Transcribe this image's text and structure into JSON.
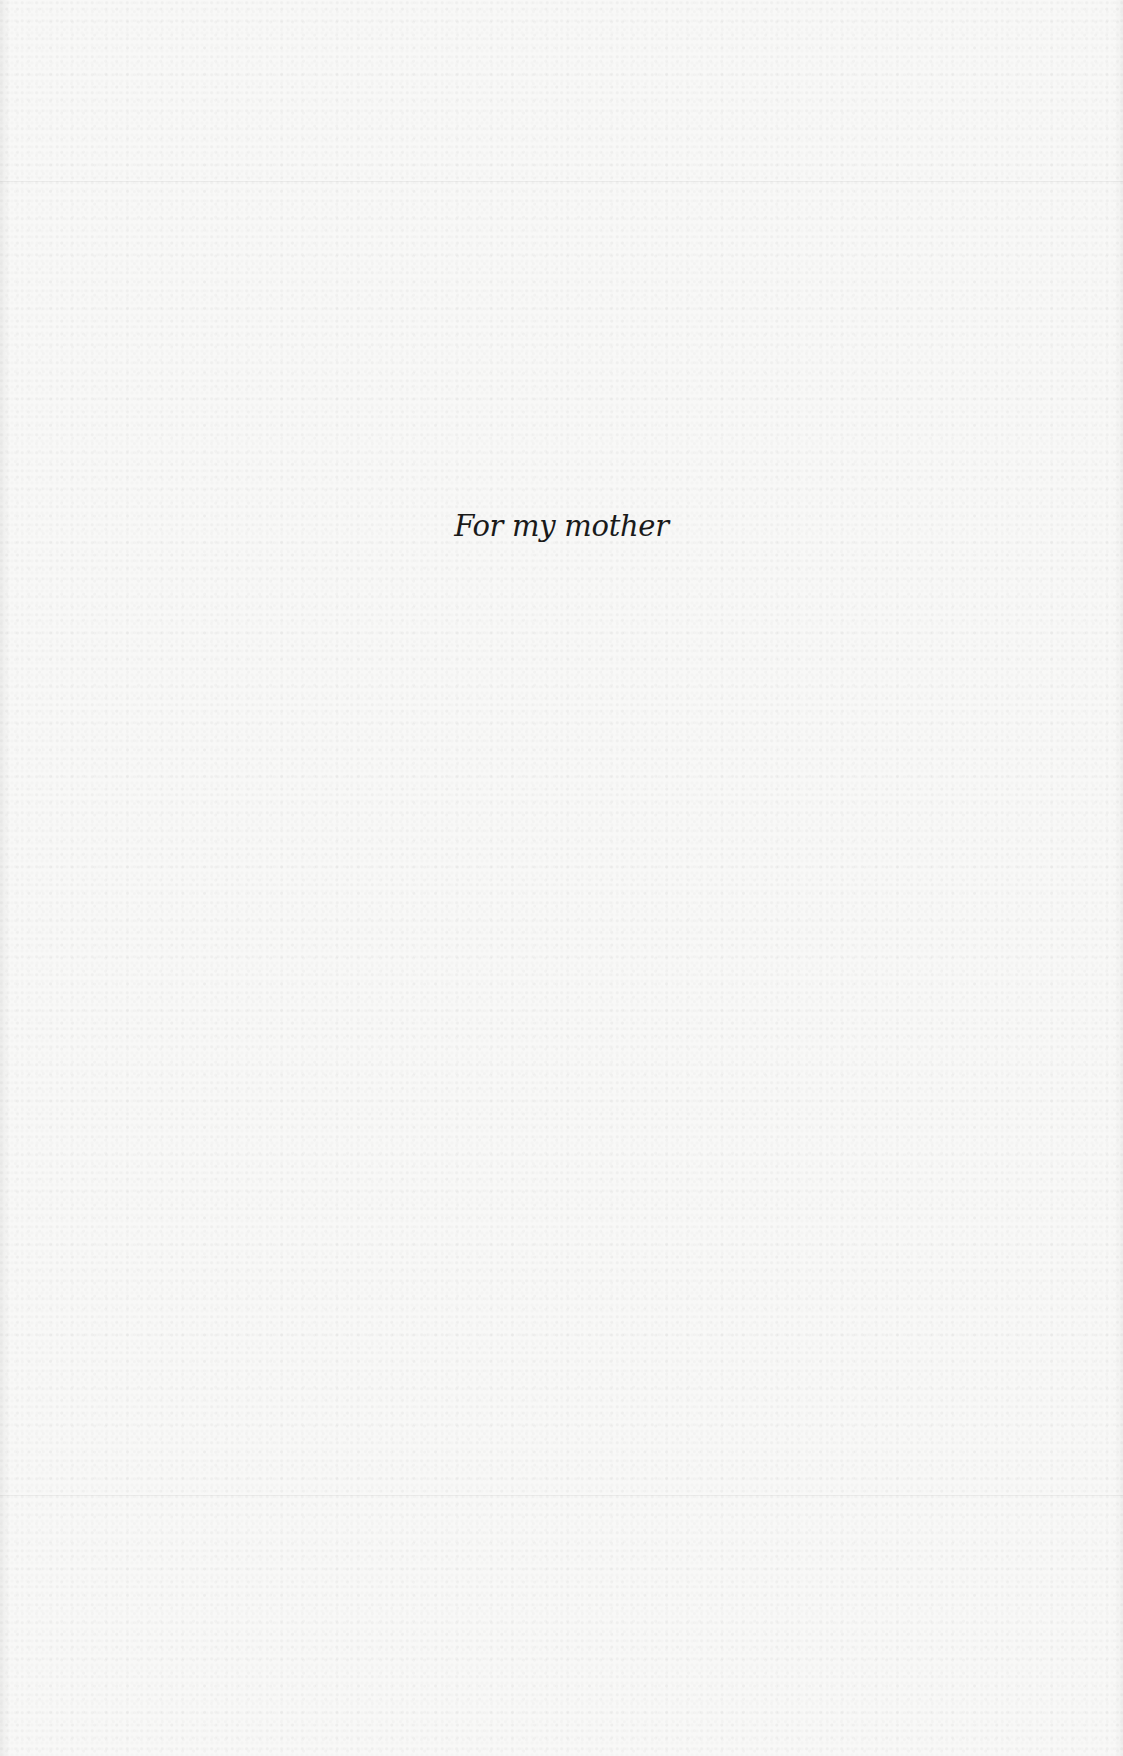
{
  "page": {
    "dedication": "For my mother"
  }
}
